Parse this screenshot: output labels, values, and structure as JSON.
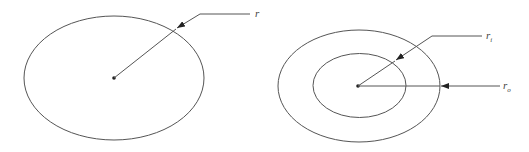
{
  "diagram": {
    "type": "geometry-radius-illustration",
    "solid_circle": {
      "label": "r",
      "description": "Solid circular cross-section with radius r"
    },
    "hollow_circle": {
      "inner_label_base": "r",
      "inner_label_sub": "i",
      "outer_label_base": "r",
      "outer_label_sub": "o",
      "description": "Hollow circular cross-section with inner radius r_i and outer radius r_o"
    },
    "colors": {
      "line": "#555555",
      "text": "#444444",
      "background": "#ffffff"
    }
  }
}
